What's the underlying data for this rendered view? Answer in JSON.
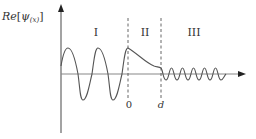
{
  "y_axis_label": {
    "prefix": "Re",
    "bracket_open": "[",
    "psi": "ψ",
    "arg": "(x)",
    "bracket_close": "]"
  },
  "regions": [
    {
      "label": "I"
    },
    {
      "label": "II"
    },
    {
      "label": "III"
    }
  ],
  "x_ticks": [
    {
      "label": "0"
    },
    {
      "label": "d"
    }
  ],
  "colors": {
    "axis": "#666666",
    "curve": "#555555",
    "dashed": "#555555",
    "text": "#333333"
  }
}
